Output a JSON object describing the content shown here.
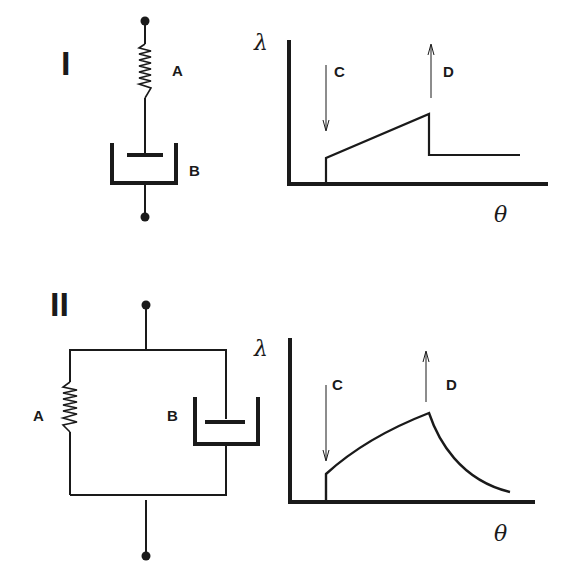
{
  "panels": [
    {
      "id": "I",
      "roman_label": "I",
      "model": "series",
      "spring_label": "A",
      "dashpot_label": "B",
      "graph": {
        "ylabel": "λ",
        "xlabel": "θ",
        "load_arrow_label": "C",
        "unload_arrow_label": "D",
        "curve_type": "linear-creep-with-permanent-set"
      }
    },
    {
      "id": "II",
      "roman_label": "II",
      "model": "parallel",
      "spring_label": "A",
      "dashpot_label": "B",
      "graph": {
        "ylabel": "λ",
        "xlabel": "θ",
        "load_arrow_label": "C",
        "unload_arrow_label": "D",
        "curve_type": "delayed-elastic-recovery"
      }
    }
  ],
  "colors": {
    "ink": "#1a1a1a",
    "paper": "#ffffff"
  }
}
